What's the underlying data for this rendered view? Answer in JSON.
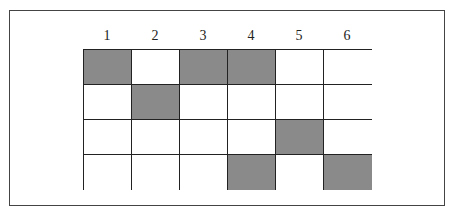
{
  "diagram": {
    "type": "grid",
    "column_labels": [
      "1",
      "2",
      "3",
      "4",
      "5",
      "6"
    ],
    "rows": 4,
    "columns": 6,
    "fill_color": "#8a8a8a",
    "empty_color": "#ffffff",
    "cells": [
      [
        1,
        0,
        1,
        1,
        0,
        0
      ],
      [
        0,
        1,
        0,
        0,
        0,
        0
      ],
      [
        0,
        0,
        0,
        0,
        1,
        0
      ],
      [
        0,
        0,
        0,
        1,
        0,
        1
      ]
    ]
  }
}
